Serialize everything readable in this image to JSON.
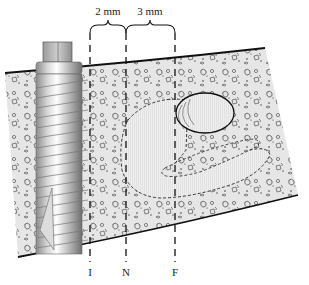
{
  "diagram": {
    "type": "cross-section illustration",
    "measurements": [
      {
        "label": "2 mm",
        "from": "I",
        "to": "N"
      },
      {
        "label": "3 mm",
        "from": "N",
        "to": "F"
      }
    ],
    "markers": [
      {
        "id": "I",
        "label": "I"
      },
      {
        "id": "N",
        "label": "N"
      },
      {
        "id": "F",
        "label": "F"
      }
    ],
    "colors": {
      "bone_fill": "#e4e4e4",
      "outline": "#1a1a1a",
      "canal_fill": "#ececec",
      "screw_light": "#f2f2f2",
      "screw_dark": "#7a7a7a"
    }
  }
}
